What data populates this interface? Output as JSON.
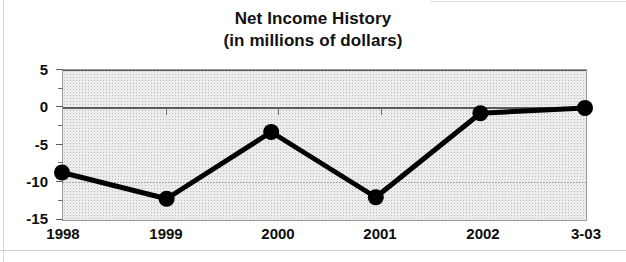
{
  "chart_data": {
    "type": "line",
    "title": "Net Income History",
    "subtitle": "(in millions of dollars)",
    "xlabel": "",
    "ylabel": "",
    "categories": [
      "1998",
      "1999",
      "2000",
      "2001",
      "2002",
      "3-03"
    ],
    "values": [
      -8.8,
      -12.3,
      -3.4,
      -12.1,
      -0.9,
      -0.2
    ],
    "series": [
      {
        "name": "Net Income",
        "values": [
          -8.8,
          -12.3,
          -3.4,
          -12.1,
          -0.9,
          -0.2
        ]
      }
    ],
    "ylim": [
      -15,
      5
    ],
    "yticks": [
      5,
      0,
      -5,
      -10,
      -15
    ],
    "ytick_labels": [
      "5",
      "0",
      "-5",
      "-10",
      "-15"
    ],
    "grid": true,
    "legend": false,
    "legend_position": "none",
    "marker": "filled-circle",
    "line_color": "#000000",
    "marker_color": "#000000",
    "plot_background": "#ececec",
    "annotations": []
  },
  "title": {
    "line1": "Net Income History",
    "line2": "(in millions of dollars)"
  },
  "axes": {
    "y_labels": [
      "5",
      "0",
      "-5",
      "-10",
      "-15"
    ],
    "x_labels": [
      "1998",
      "1999",
      "2000",
      "2001",
      "2002",
      "3-03"
    ]
  }
}
